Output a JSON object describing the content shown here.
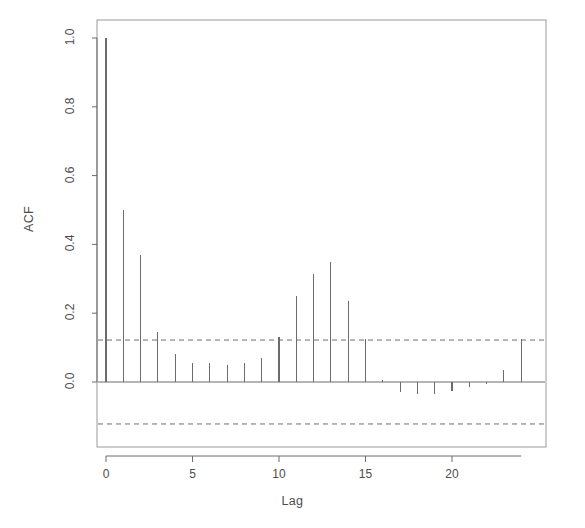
{
  "chart_data": {
    "type": "bar",
    "title": "",
    "subtitle": "",
    "xlabel": "Lag",
    "ylabel": "ACF",
    "xlim": [
      -0.6,
      24.8
    ],
    "ylim": [
      -0.18,
      1.02
    ],
    "grid": false,
    "legend": null,
    "categories": [
      0,
      1,
      2,
      3,
      4,
      5,
      6,
      7,
      8,
      9,
      10,
      11,
      12,
      13,
      14,
      15,
      16,
      17,
      18,
      19,
      20,
      21,
      22,
      23,
      24
    ],
    "values": [
      1.0,
      0.5,
      0.37,
      0.145,
      0.08,
      0.055,
      0.055,
      0.05,
      0.055,
      0.07,
      0.13,
      0.25,
      0.315,
      0.35,
      0.235,
      0.125,
      0.005,
      -0.03,
      -0.035,
      -0.035,
      -0.025,
      -0.015,
      -0.005,
      0.035,
      0.125
    ],
    "xticks": [
      0,
      5,
      10,
      15,
      20
    ],
    "xtick_labels": [
      "0",
      "5",
      "10",
      "15",
      "20"
    ],
    "yticks": [
      0.0,
      0.2,
      0.4,
      0.6,
      0.8,
      1.0
    ],
    "ytick_labels": [
      "0.0",
      "0.2",
      "0.4",
      "0.6",
      "0.8",
      "1.0"
    ],
    "confidence_bands": {
      "upper": 0.122,
      "lower": -0.122,
      "style": "dashed",
      "color": "#6e6e6e"
    },
    "zero_line": 0.0,
    "colors": {
      "bar": "#6b6b6b",
      "axis": "#6b6b6b",
      "box": "#9a9a9a",
      "text": "#4d4d4d",
      "background": "#ffffff"
    }
  }
}
